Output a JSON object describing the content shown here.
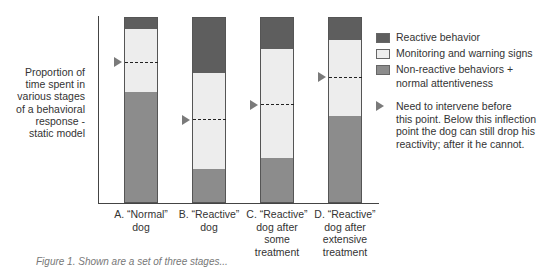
{
  "chart_data": {
    "type": "bar",
    "stacked": true,
    "title": "",
    "ylabel": "Proportion of time spent in various stages of a behavioral response - static model",
    "xlabel": "",
    "ylim": [
      0,
      100
    ],
    "ylabel_lines": [
      "Proportion of",
      "time spent in",
      "various stages",
      "of a behavioral",
      "response -",
      "static model"
    ],
    "categories": [
      "A. “Normal” dog",
      "B. “Reactive” dog",
      "C. “Reactive” dog after some treatment",
      "D. “Reactive” dog after extensive treatment"
    ],
    "category_lines": [
      [
        "A. “Normal”",
        "dog"
      ],
      [
        "B. “Reactive”",
        "dog"
      ],
      [
        "C. “Reactive”",
        "dog after",
        "some",
        "treatment"
      ],
      [
        "D. “Reactive”",
        "dog after",
        "extensive",
        "treatment"
      ]
    ],
    "series": [
      {
        "name": "Non-reactive behaviors + normal attentiveness",
        "color": "#8c8c8c",
        "values": [
          60,
          18,
          24,
          47
        ]
      },
      {
        "name": "Monitoring and warning signs",
        "color": "#ededed",
        "values": [
          34,
          52,
          59,
          41
        ]
      },
      {
        "name": "Reactive behavior",
        "color": "#5e5e5e",
        "values": [
          6,
          30,
          17,
          12
        ]
      }
    ],
    "intervention_threshold": {
      "label": "Need to intervene before this point. Below this inflection point the dog can still drop his reactivity; after it he cannot.",
      "values": [
        76,
        45,
        53,
        68
      ]
    },
    "legend_position": "right",
    "grid": false
  },
  "legend": {
    "items": [
      {
        "label": "Reactive behavior",
        "color": "#5e5e5e"
      },
      {
        "label": "Monitoring and warning signs",
        "color": "#ededed"
      },
      {
        "label": "Non-reactive behaviors +",
        "cont": "normal attentiveness",
        "color": "#8c8c8c"
      }
    ],
    "note_lines": [
      "Need to intervene before",
      "this point. Below this inflection",
      "point the dog can still drop his",
      "reactivity; after it he cannot."
    ]
  },
  "caption": "Figure 1. Shown are a set of three stages..."
}
